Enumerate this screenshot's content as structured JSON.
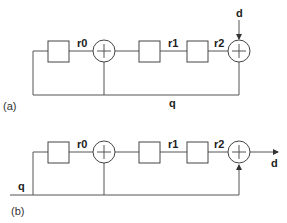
{
  "diagram_a": {
    "caption": "(a)",
    "registers": [
      "r0",
      "r1",
      "r2"
    ],
    "input_label": "d",
    "feedback_label": "q"
  },
  "diagram_b": {
    "caption": "(b)",
    "registers": [
      "r0",
      "r1",
      "r2"
    ],
    "output_label": "d",
    "feedback_label": "q"
  },
  "colors": {
    "stroke": "#444444",
    "background": "#ffffff"
  }
}
